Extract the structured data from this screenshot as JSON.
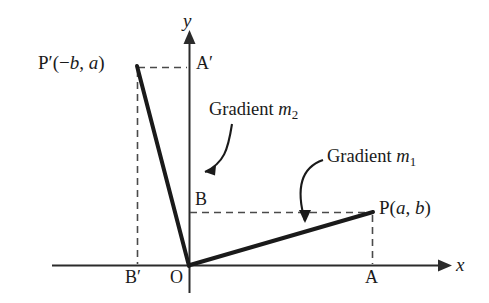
{
  "figure": {
    "background_color": "#ffffff",
    "stroke_color": "#1a1a1a",
    "axis_color": "#2b2b2b",
    "dash_color": "#4a4a4a"
  },
  "axes": {
    "x_label": "x",
    "y_label": "y",
    "origin_label": "O"
  },
  "points": {
    "p": {
      "label": "P(a, b)",
      "x": 372,
      "y": 212
    },
    "p_prime": {
      "label": "P′(−b, a)",
      "x": 137,
      "y": 67
    },
    "a": {
      "label": "A",
      "x": 372,
      "y": 265
    },
    "a_prime": {
      "label": "A′",
      "x": 189,
      "y": 67
    },
    "b": {
      "label": "B",
      "x": 189,
      "y": 212
    },
    "b_prime": {
      "label": "B′",
      "x": 137,
      "y": 265
    }
  },
  "annotations": {
    "gradient_m1": {
      "text_prefix": "Gradient ",
      "symbol": "m",
      "subscript": "1"
    },
    "gradient_m2": {
      "text_prefix": "Gradient ",
      "symbol": "m",
      "subscript": "2"
    }
  },
  "chart_data": {
    "type": "line",
    "xlabel": "x",
    "ylabel": "y",
    "grid": false,
    "legend": "none",
    "series": [
      {
        "name": "Gradient m1",
        "points": [
          [
            0,
            0
          ],
          [
            "a",
            "b"
          ]
        ],
        "endpoint_label": "P(a, b)",
        "style": "solid-thick"
      },
      {
        "name": "Gradient m2",
        "points": [
          [
            0,
            0
          ],
          [
            "-b",
            "a"
          ]
        ],
        "endpoint_label": "P′(−b, a)",
        "style": "solid-thick"
      }
    ],
    "construction_lines": [
      {
        "from": "P(a, b)",
        "to": "A",
        "style": "dashed",
        "meaning": "vertical drop to x-axis"
      },
      {
        "from": "B",
        "to": "P(a, b)",
        "style": "dashed",
        "meaning": "horizontal to y-axis"
      },
      {
        "from": "P′(−b, a)",
        "to": "B′",
        "style": "dashed",
        "meaning": "vertical drop to x-axis"
      },
      {
        "from": "P′(−b, a)",
        "to": "A′",
        "style": "dashed",
        "meaning": "horizontal to y-axis"
      }
    ],
    "annotations": [
      "Gradient m1",
      "Gradient m2"
    ]
  }
}
